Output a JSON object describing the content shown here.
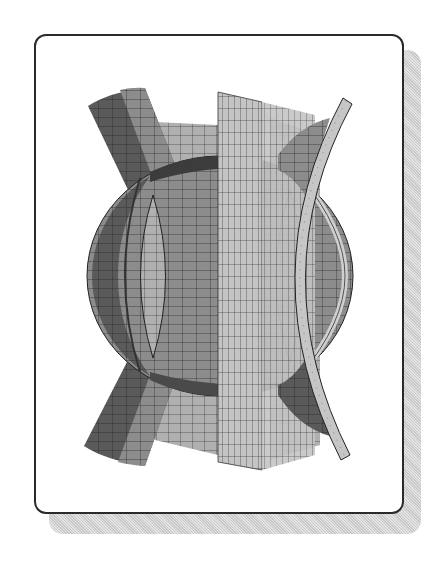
{
  "figure": {
    "colors": {
      "frame": "#2a2a2a",
      "shadow": "#d0d0d0",
      "dark_surface": "#555555",
      "mid_surface": "#8a8a8a",
      "light_surface": "#bdbdbd",
      "grid_line": "#222222",
      "background": "#ffffff"
    }
  }
}
